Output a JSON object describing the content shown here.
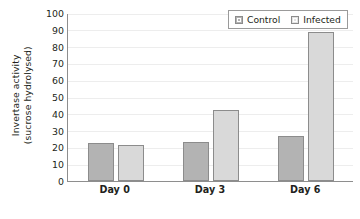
{
  "chart_data": {
    "type": "bar",
    "title": "",
    "xlabel": "",
    "ylabel_line1": "Invertase activity",
    "ylabel_line2": "(sucrose hydrolysed)",
    "categories": [
      "Day 0",
      "Day 3",
      "Day 6"
    ],
    "series": [
      {
        "name": "Control",
        "values": [
          22.5,
          23.0,
          26.5
        ],
        "color": "#b3b3b3"
      },
      {
        "name": "Infected",
        "values": [
          21.5,
          42.5,
          88.5
        ],
        "color": "#d9d9d9"
      }
    ],
    "ylim": [
      0,
      100
    ],
    "yticks": [
      0,
      10,
      20,
      30,
      40,
      50,
      60,
      70,
      80,
      90,
      100
    ],
    "ytick_labels": [
      "0",
      "10",
      "20",
      "30",
      "40",
      "50",
      "60",
      "70",
      "80",
      "90",
      "100"
    ],
    "grid": "horizontal",
    "legend_position": "top-right"
  },
  "legend": {
    "entries": [
      {
        "label": "Control"
      },
      {
        "label": "Infected"
      }
    ]
  }
}
